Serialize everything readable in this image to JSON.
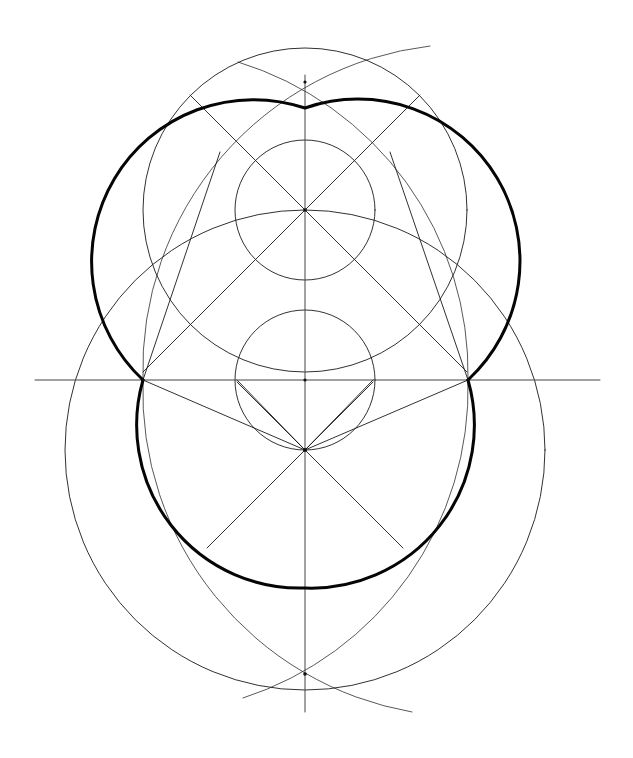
{
  "figure": {
    "kind": "line-drawing",
    "background_color": "#ffffff",
    "ink_color": "#111111",
    "canvas": {
      "width": 633,
      "height": 758
    }
  },
  "geometry": {
    "center": {
      "x": 305,
      "y": 380
    },
    "upper_center": {
      "x": 305,
      "y": 210
    },
    "lower_center": {
      "x": 305,
      "y": 450
    },
    "apex_top": {
      "x": 305,
      "y": 108
    },
    "arc_cross_top": {
      "x": 305,
      "y": 82
    },
    "arc_cross_bottom": {
      "x": 305,
      "y": 674
    },
    "left_waist": {
      "x": 143,
      "y": 380
    },
    "right_waist": {
      "x": 468,
      "y": 380
    },
    "small_circle_radius": 70,
    "big_circle_radius": 162,
    "lower_arc_radius": 138,
    "outer_arc_radius": 240
  },
  "elements": {
    "horizontal_axis": {
      "label": "horizontal construction axis",
      "x1": 35,
      "y1": 380,
      "x2": 600,
      "y2": 380
    },
    "vertical_axis": {
      "label": "vertical construction axis",
      "x1": 305,
      "y1": 75,
      "x2": 305,
      "y2": 712
    },
    "upper_small_circle": {
      "label": "upper inner circle",
      "cx": 305,
      "cy": 210,
      "r": 70
    },
    "lower_small_circle": {
      "label": "lower inner circle",
      "cx": 305,
      "cy": 380,
      "r": 70
    },
    "main_circle": {
      "label": "main generating circle",
      "cx": 305,
      "cy": 210,
      "r": 162
    },
    "lower_circle": {
      "label": "lower generating circle",
      "cx": 305,
      "cy": 450,
      "r": 162
    },
    "egg_outline": {
      "label": "egg outline (heavy)",
      "stroke_width": 3.0
    },
    "crossing_arcs_top": {
      "label": "top bisector arcs crossing",
      "cx": 305,
      "cy": 82
    },
    "crossing_arcs_bottom": {
      "label": "bottom bisector arcs crossing",
      "cx": 305,
      "cy": 674
    },
    "rays_upper": {
      "label": "45-degree rays from upper centre",
      "count": 4
    },
    "rays_lower": {
      "label": "45-degree rays from lower centre",
      "count": 4
    }
  },
  "notes": {
    "visible_text": "",
    "labels": []
  }
}
